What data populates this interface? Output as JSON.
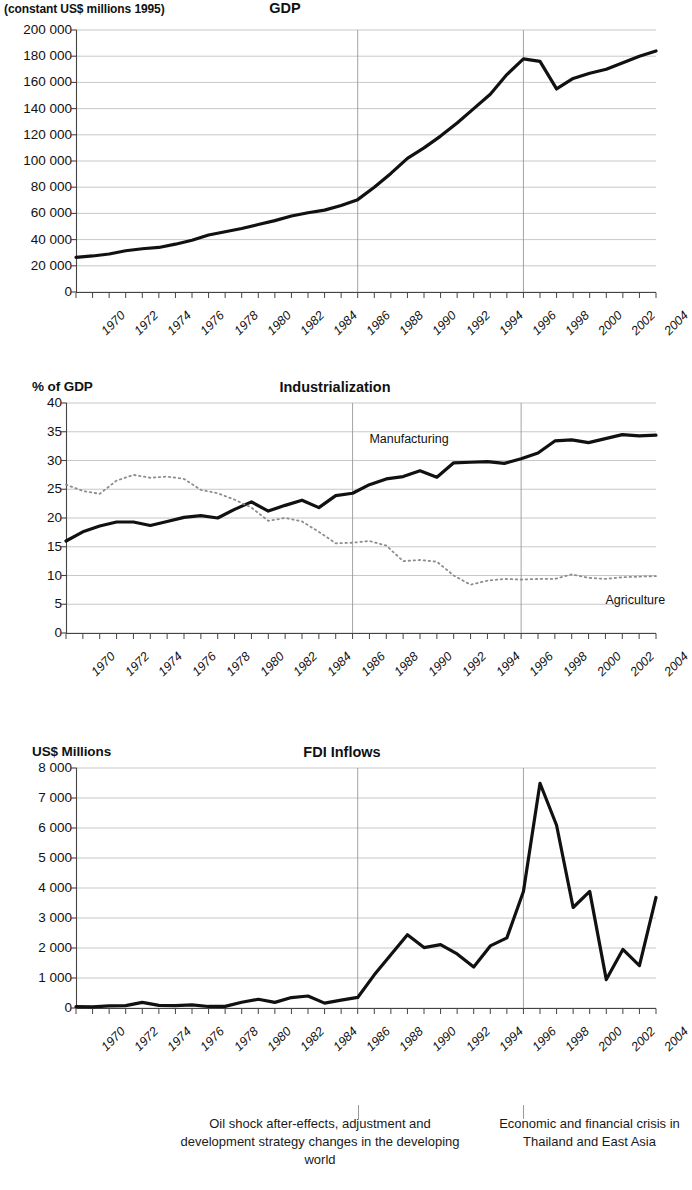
{
  "figure": {
    "annotations": [
      {
        "id": "oil-shock",
        "text": "Oil shock after-effects, adjustment and development strategy changes in the developing world",
        "marker_year": 1987
      },
      {
        "id": "asian-crisis",
        "text": "Economic and financial crisis in Thailand and East Asia",
        "marker_year": 1997
      }
    ],
    "marker_line_color": "#9a9a9a",
    "grid_color": "#b0b0b0",
    "axis_color": "#555555",
    "line_color": "#111111"
  },
  "chart_data": [
    {
      "type": "line",
      "id": "gdp",
      "title": "GDP",
      "ylabel": "(constant US$ millions 1995)",
      "xlabel": "",
      "ylim": [
        0,
        200000
      ],
      "ytick_labels": [
        "0",
        "20 000",
        "40 000",
        "60 000",
        "80 000",
        "100 000",
        "120 000",
        "140 000",
        "160 000",
        "180 000",
        "200 000"
      ],
      "yticks": [
        0,
        20000,
        40000,
        60000,
        80000,
        100000,
        120000,
        140000,
        160000,
        180000,
        200000
      ],
      "xlim": [
        1970,
        2005
      ],
      "xtick_labels": [
        "1970",
        "1972",
        "1974",
        "1976",
        "1978",
        "1980",
        "1982",
        "1984",
        "1986",
        "1988",
        "1990",
        "1992",
        "1994",
        "1996",
        "1998",
        "2000",
        "2002",
        "2004"
      ],
      "grid": true,
      "legend": "none",
      "x": [
        1970,
        1971,
        1972,
        1973,
        1974,
        1975,
        1976,
        1977,
        1978,
        1979,
        1980,
        1981,
        1982,
        1983,
        1984,
        1985,
        1986,
        1987,
        1988,
        1989,
        1990,
        1991,
        1992,
        1993,
        1994,
        1995,
        1996,
        1997,
        1998,
        1999,
        2000,
        2001,
        2002,
        2003,
        2004,
        2005
      ],
      "series": [
        {
          "name": "GDP",
          "values": [
            26500,
            27500,
            29000,
            31500,
            33000,
            34000,
            36500,
            39500,
            43500,
            46000,
            48500,
            51500,
            54500,
            58000,
            60500,
            62500,
            66000,
            70500,
            80000,
            90500,
            102000,
            110000,
            119000,
            129000,
            140000,
            151000,
            166000,
            178000,
            176000,
            155000,
            163000,
            167000,
            170000,
            175000,
            180000,
            184000
          ]
        }
      ]
    },
    {
      "type": "line",
      "id": "industrialization",
      "title": "Industrialization",
      "ylabel": "% of GDP",
      "xlabel": "",
      "ylim": [
        0,
        40
      ],
      "ytick_labels": [
        "0",
        "5",
        "10",
        "15",
        "20",
        "25",
        "30",
        "35",
        "40"
      ],
      "yticks": [
        0,
        5,
        10,
        15,
        20,
        25,
        30,
        35,
        40
      ],
      "xlim": [
        1970,
        2005
      ],
      "xtick_labels": [
        "1970",
        "1972",
        "1974",
        "1976",
        "1978",
        "1980",
        "1982",
        "1984",
        "1986",
        "1988",
        "1990",
        "1992",
        "1994",
        "1996",
        "1998",
        "2000",
        "2002",
        "2004"
      ],
      "grid": true,
      "legend": "inline-labels",
      "x": [
        1970,
        1971,
        1972,
        1973,
        1974,
        1975,
        1976,
        1977,
        1978,
        1979,
        1980,
        1981,
        1982,
        1983,
        1984,
        1985,
        1986,
        1987,
        1988,
        1989,
        1990,
        1991,
        1992,
        1993,
        1994,
        1995,
        1996,
        1997,
        1998,
        1999,
        2000,
        2001,
        2002,
        2003,
        2004,
        2005
      ],
      "series": [
        {
          "name": "Manufacturing",
          "style": "solid",
          "values": [
            16.0,
            17.6,
            18.6,
            19.3,
            19.3,
            18.7,
            19.4,
            20.1,
            20.4,
            20.0,
            21.5,
            22.8,
            21.2,
            22.2,
            23.1,
            21.8,
            23.9,
            24.3,
            25.8,
            26.8,
            27.2,
            28.2,
            27.1,
            29.6,
            29.7,
            29.8,
            29.5,
            30.3,
            31.3,
            33.4,
            33.6,
            33.1,
            33.8,
            34.5,
            34.3,
            34.4
          ]
        },
        {
          "name": "Agriculture",
          "style": "dotted",
          "values": [
            25.8,
            24.7,
            24.2,
            26.5,
            27.5,
            27.0,
            27.2,
            26.8,
            24.9,
            24.3,
            23.2,
            21.8,
            19.5,
            20.0,
            19.4,
            17.6,
            15.6,
            15.7,
            16.0,
            15.2,
            12.5,
            12.7,
            12.4,
            10.0,
            8.4,
            9.1,
            9.4,
            9.3,
            9.4,
            9.4,
            10.2,
            9.6,
            9.4,
            9.7,
            9.8,
            9.9
          ]
        }
      ],
      "series_label_positions": {
        "Manufacturing": {
          "year": 1988,
          "value": 33.3
        },
        "Agriculture": {
          "year": 2002,
          "value": 8.0
        }
      }
    },
    {
      "type": "line",
      "id": "fdi",
      "title": "FDI Inflows",
      "ylabel": "US$ Millions",
      "xlabel": "",
      "ylim": [
        0,
        8000
      ],
      "ytick_labels": [
        "0",
        "1 000",
        "2 000",
        "3 000",
        "4 000",
        "5 000",
        "6 000",
        "7 000",
        "8 000"
      ],
      "yticks": [
        0,
        1000,
        2000,
        3000,
        4000,
        5000,
        6000,
        7000,
        8000
      ],
      "xlim": [
        1970,
        2005
      ],
      "xtick_labels": [
        "1970",
        "1972",
        "1974",
        "1976",
        "1978",
        "1980",
        "1982",
        "1984",
        "1986",
        "1988",
        "1990",
        "1992",
        "1994",
        "1996",
        "1998",
        "2000",
        "2002",
        "2004"
      ],
      "grid": true,
      "legend": "none",
      "x": [
        1970,
        1971,
        1972,
        1973,
        1974,
        1975,
        1976,
        1977,
        1978,
        1979,
        1980,
        1981,
        1982,
        1983,
        1984,
        1985,
        1986,
        1987,
        1988,
        1989,
        1990,
        1991,
        1992,
        1993,
        1994,
        1995,
        1996,
        1997,
        1998,
        1999,
        2000,
        2001,
        2002,
        2003,
        2004,
        2005
      ],
      "series": [
        {
          "name": "FDI Inflows",
          "values": [
            43,
            39,
            69,
            77,
            189,
            86,
            79,
            106,
            51,
            55,
            190,
            291,
            188,
            348,
            400,
            163,
            263,
            352,
            1105,
            1775,
            2444,
            2014,
            2113,
            1804,
            1366,
            2070,
            2338,
            3882,
            7492,
            6091,
            3350,
            3886,
            947,
            1952,
            1414,
            3685
          ]
        }
      ]
    }
  ]
}
